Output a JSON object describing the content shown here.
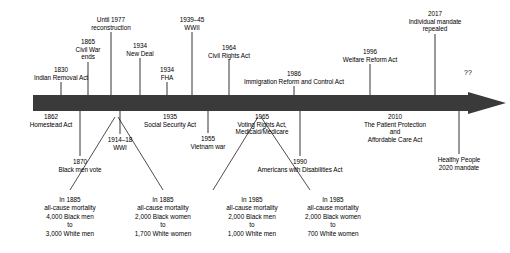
{
  "figure": {
    "kind": "historical-timeline",
    "arrow_color": "#3a3a3a",
    "text_color": "#000000",
    "background": "#ffffff",
    "axis_label": "",
    "future_marker": "??"
  },
  "timeline": {
    "bar": {
      "x_start": 33,
      "x_end": 468,
      "y_top": 95,
      "y_bottom": 111,
      "tip_x": 506,
      "head_half_height": 19
    },
    "events_above": [
      {
        "id": "indian-removal-act",
        "year": "1830",
        "title": "Indian Removal Act",
        "tick_x": 61,
        "text_x": 61,
        "text_y": 66,
        "tick_top": 82,
        "lines": [
          "1830",
          "Indian Removal Act"
        ]
      },
      {
        "id": "civil-war-ends",
        "year": "1865",
        "title": "Civil War ends",
        "tick_x": 88,
        "text_x": 88,
        "text_y": 38,
        "tick_top": 62,
        "lines": [
          "1865",
          "Civil War",
          "ends"
        ]
      },
      {
        "id": "reconstruction",
        "year": "Until 1977",
        "title": "reconstruction",
        "tick_x": 111,
        "text_x": 111,
        "text_y": 16,
        "tick_top": 32,
        "lines": [
          "Until 1977",
          "reconstruction"
        ]
      },
      {
        "id": "new-deal",
        "year": "1934",
        "title": "New Deal",
        "tick_x": 140,
        "text_x": 140,
        "text_y": 42,
        "tick_top": 58,
        "lines": [
          "1934",
          "New Deal"
        ]
      },
      {
        "id": "fha",
        "year": "1934",
        "title": "FHA",
        "tick_x": 167,
        "text_x": 167,
        "text_y": 66,
        "tick_top": 82,
        "lines": [
          "1934",
          "FHA"
        ]
      },
      {
        "id": "wwii",
        "year": "1939–45",
        "title": "WWII",
        "tick_x": 192,
        "text_x": 192,
        "text_y": 16,
        "tick_top": 32,
        "lines": [
          "1939–45",
          "WWII"
        ]
      },
      {
        "id": "civil-rights-act",
        "year": "1964",
        "title": "Civil Rights Act",
        "tick_x": 229,
        "text_x": 229,
        "text_y": 44,
        "tick_top": 60,
        "lines": [
          "1964",
          "Civil Rights Act"
        ]
      },
      {
        "id": "immigration-reform-and-control-act",
        "year": "1986",
        "title": "Immigration Reform and Control Act",
        "tick_x": 294,
        "text_x": 294,
        "text_y": 70,
        "tick_top": 86,
        "lines": [
          "1986",
          "Immigration Reform and Control Act"
        ]
      },
      {
        "id": "welfare-reform-act",
        "year": "1996",
        "title": "Welfare Reform Act",
        "tick_x": 370,
        "text_x": 370,
        "text_y": 48,
        "tick_top": 64,
        "lines": [
          "1996",
          "Welfare Reform Act"
        ]
      },
      {
        "id": "individual-mandate-repealed",
        "year": "2017",
        "title": "Individual mandate repealed",
        "tick_x": 435,
        "text_x": 435,
        "text_y": 10,
        "tick_top": 34,
        "lines": [
          "2017",
          "Individual mandate",
          "repealed"
        ]
      }
    ],
    "events_below": [
      {
        "id": "homestead-act",
        "year": "1862",
        "title": "Homestead Act",
        "tick_x": 51,
        "text_x": 51,
        "text_y": 113,
        "tick_bottom": 111,
        "lines": [
          "1862",
          "Homestead Act"
        ]
      },
      {
        "id": "wwi",
        "year": "1914–18",
        "title": "WWI",
        "tick_x": 120,
        "text_x": 120,
        "text_y": 136,
        "tick_bottom": 111,
        "lines": [
          "1914–18",
          "WWI"
        ]
      },
      {
        "id": "social-security-act",
        "year": "1935",
        "title": "Social Security Act",
        "tick_x": 170,
        "text_x": 170,
        "text_y": 113,
        "tick_bottom": 111,
        "lines": [
          "1935",
          "Social Security Act"
        ]
      },
      {
        "id": "vietnam-war",
        "year": "1955",
        "title": "Vietnam war",
        "tick_x": 208,
        "text_x": 208,
        "text_y": 135,
        "tick_bottom": 111,
        "lines": [
          "1955",
          "Vietnam war"
        ]
      },
      {
        "id": "voting-rights-medicaid-medicare",
        "year": "1965",
        "title": "Voting Rights Act, Medicaid/Medicare",
        "tick_x": 262,
        "text_x": 262,
        "text_y": 113,
        "tick_bottom": 111,
        "lines": [
          "1965",
          "Voting Rights Act,",
          "Medicaid/Medicare"
        ]
      },
      {
        "id": "black-men-vote",
        "year": "1870",
        "title": "Black men vote",
        "tick_x": 80,
        "text_x": 80,
        "text_y": 158,
        "tick_bottom": 111,
        "lines": [
          "1870",
          "Black men vote"
        ]
      },
      {
        "id": "americans-with-disabilities-act",
        "year": "1990",
        "title": "Americans with Disabilities Act",
        "tick_x": 300,
        "text_x": 300,
        "text_y": 158,
        "tick_bottom": 111,
        "lines": [
          "1990",
          "Americans with Disabilities Act"
        ]
      },
      {
        "id": "affordable-care-act",
        "year": "2010",
        "title": "The Patient Protection and Affordable Care Act",
        "tick_x": 395,
        "text_x": 395,
        "text_y": 113,
        "tick_bottom": 111,
        "lines": [
          "2010",
          "The Patient Protection",
          "and",
          "Affordable Care Act"
        ]
      },
      {
        "id": "healthy-people-2020-mandate",
        "year": "",
        "title": "Healthy People 2020 mandate",
        "tick_x": 459,
        "text_x": 459,
        "text_y": 156,
        "tick_bottom": 111,
        "lines": [
          "Healthy People",
          "2020 mandate"
        ]
      }
    ],
    "mortality_callouts": [
      {
        "id": "mortality-1885-men",
        "text_x": 70,
        "text_y": 196,
        "apex_x": 115,
        "apex_y": 117,
        "leader_end_x": 70,
        "leader_end_y": 190,
        "lines": [
          "In 1885",
          "all-cause mortality",
          "4,000 Black men",
          "to",
          "3,000 White men"
        ]
      },
      {
        "id": "mortality-1885-women",
        "text_x": 163,
        "text_y": 196,
        "apex_x": 118,
        "apex_y": 117,
        "leader_end_x": 163,
        "leader_end_y": 190,
        "lines": [
          "In 1885",
          "all-cause mortality",
          "2,000 Black women",
          "to",
          "1,700 White women"
        ]
      },
      {
        "id": "mortality-1965-men",
        "text_x": 252,
        "text_y": 196,
        "apex_x": 258,
        "apex_y": 117,
        "leader_end_x": 213,
        "leader_end_y": 190,
        "lines": [
          "In 1985",
          "all-cause mortality",
          "2,000 Black men",
          "to",
          "1,000 White men"
        ]
      },
      {
        "id": "mortality-1965-women",
        "text_x": 333,
        "text_y": 196,
        "apex_x": 261,
        "apex_y": 117,
        "leader_end_x": 310,
        "leader_end_y": 190,
        "lines": [
          "In 1985",
          "all-cause mortality",
          "2,000 Black women",
          "to",
          "700 White women"
        ]
      }
    ],
    "future": {
      "label": "??",
      "x": 468,
      "y": 69
    }
  }
}
